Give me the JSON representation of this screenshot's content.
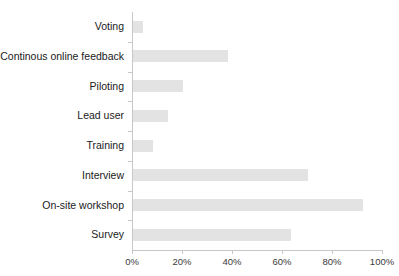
{
  "chart_data": {
    "type": "bar",
    "orientation": "horizontal",
    "title": "",
    "xlabel": "",
    "ylabel": "",
    "xlim": [
      0,
      100
    ],
    "xticks": [
      0,
      20,
      40,
      60,
      80,
      100
    ],
    "xtick_labels": [
      "0%",
      "20%",
      "40%",
      "60%",
      "80%",
      "100%"
    ],
    "grid": false,
    "legend": false,
    "bar_color": "#e3e3e3",
    "axis_color": "#c8c8c8",
    "label_color": "#1a1a1a",
    "categories": [
      "Voting",
      "Continous online feedback",
      "Piloting",
      "Lead user",
      "Training",
      "Interview",
      "On-site workshop",
      "Survey"
    ],
    "values": [
      4,
      38,
      20,
      14,
      8,
      70,
      92,
      63
    ],
    "value_labels": [
      "4%",
      "38%",
      "20%",
      "14%",
      "8%",
      "70%",
      "92%",
      "63%"
    ]
  }
}
